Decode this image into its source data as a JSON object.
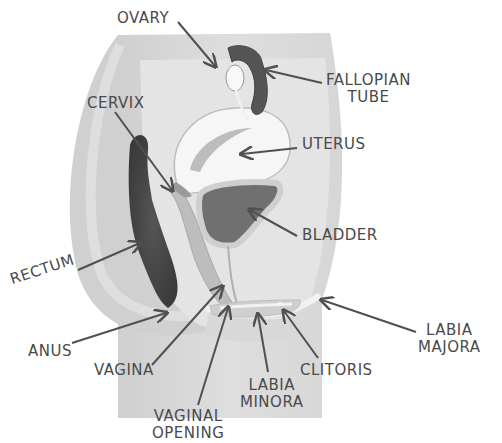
{
  "diagram": {
    "colors": {
      "background": "#ffffff",
      "body_block": "#d4d4d4",
      "body_block_light": "#e2e2e2",
      "rectum": "#4a4a4a",
      "uterus": "#f4f4f4",
      "bladder": "#6e6e6e",
      "fallopian_tube": "#4f4f4f",
      "label_text": "#4a4a4a",
      "arrow": "#505050"
    },
    "labels": [
      {
        "id": "ovary",
        "lines": [
          "OVARY"
        ],
        "x": 117,
        "y": 10
      },
      {
        "id": "fallopian-tube",
        "lines": [
          "FALLOPIAN",
          "TUBE"
        ],
        "x": 326,
        "y": 72
      },
      {
        "id": "cervix",
        "lines": [
          "CERVIX"
        ],
        "x": 87,
        "y": 95
      },
      {
        "id": "uterus",
        "lines": [
          "UTERUS"
        ],
        "x": 302,
        "y": 134
      },
      {
        "id": "bladder",
        "lines": [
          "BLADDER"
        ],
        "x": 302,
        "y": 225
      },
      {
        "id": "rectum",
        "lines": [
          "RECTUM"
        ],
        "x": 10,
        "y": 268
      },
      {
        "id": "anus",
        "lines": [
          "ANUS"
        ],
        "x": 28,
        "y": 343
      },
      {
        "id": "vagina",
        "lines": [
          "VAGINA"
        ],
        "x": 95,
        "y": 360
      },
      {
        "id": "labia-majora",
        "lines": [
          "LABIA",
          "MAJORA"
        ],
        "x": 418,
        "y": 320
      },
      {
        "id": "clitoris",
        "lines": [
          "CLITORIS"
        ],
        "x": 300,
        "y": 358
      },
      {
        "id": "labia-minora",
        "lines": [
          "LABIA",
          "MINORA"
        ],
        "x": 243,
        "y": 375
      },
      {
        "id": "vaginal-opening",
        "lines": [
          "VAGINAL",
          "OPENING"
        ],
        "x": 155,
        "y": 408
      }
    ]
  }
}
